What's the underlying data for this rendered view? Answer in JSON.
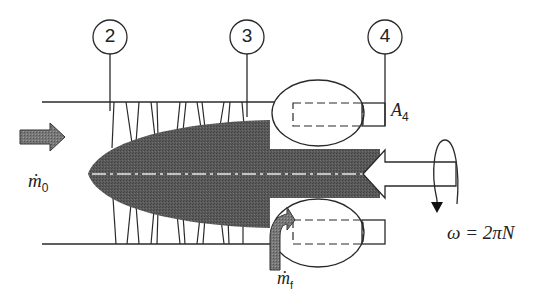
{
  "diagram": {
    "title": "",
    "stations": [
      {
        "id": "2",
        "label": "2",
        "cx": 110,
        "cy": 37
      },
      {
        "id": "3",
        "label": "3",
        "cx": 247,
        "cy": 37
      },
      {
        "id": "4",
        "label": "4",
        "cx": 385,
        "cy": 37
      }
    ],
    "labels": {
      "inlet_mass_flow": "ṁ",
      "inlet_mass_flow_sub": "0",
      "fuel_mass_flow": "ṁ",
      "fuel_mass_flow_sub": "f",
      "nozzle_area": "A",
      "nozzle_area_sub": "4",
      "angular_speed": "ω = 2πN"
    },
    "colors": {
      "line": "#2a2a2a",
      "spool_fill": "#555555",
      "arrow_fill": "#6a6a6a",
      "centerline": "#e8e8e8",
      "background": "#ffffff"
    },
    "components": [
      "inlet-flow-arrow",
      "compressor-blades",
      "compressor-spool",
      "combustor-top",
      "combustor-bottom",
      "fuel-injection-arrow",
      "turbine-shaft-arrow",
      "rotation-indicator",
      "nozzle-exit"
    ]
  }
}
